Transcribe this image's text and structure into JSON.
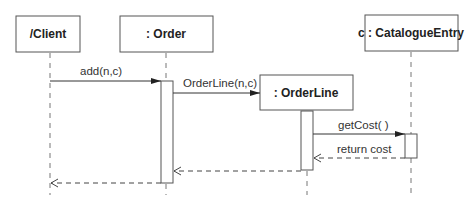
{
  "diagram": {
    "type": "sequence",
    "participants": [
      {
        "id": "client",
        "label": "/Client"
      },
      {
        "id": "order",
        "label": ": Order"
      },
      {
        "id": "orderline",
        "label": ": OrderLine"
      },
      {
        "id": "catalogue",
        "label": "c : CatalogueEntry"
      }
    ],
    "messages": [
      {
        "from": "client",
        "to": "order",
        "label": "add(n,c)",
        "kind": "call"
      },
      {
        "from": "order",
        "to": "orderline",
        "label": "OrderLine(n,c)",
        "kind": "create"
      },
      {
        "from": "orderline",
        "to": "catalogue",
        "label": "getCost( )",
        "kind": "call"
      },
      {
        "from": "catalogue",
        "to": "orderline",
        "label": "return cost",
        "kind": "return"
      },
      {
        "from": "orderline",
        "to": "order",
        "label": "",
        "kind": "return"
      },
      {
        "from": "order",
        "to": "client",
        "label": "",
        "kind": "return"
      }
    ]
  }
}
